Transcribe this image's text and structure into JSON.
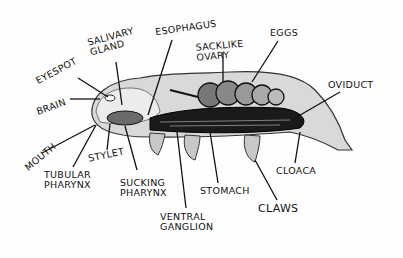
{
  "diagram": {
    "labels": [
      {
        "id": "eyespot",
        "text": "Eyespot"
      },
      {
        "id": "salivary_gland",
        "text": "Salivary Gland"
      },
      {
        "id": "esophagus",
        "text": "Esophagus"
      },
      {
        "id": "sacklike_ovary",
        "text": "Sacklike Ovary"
      },
      {
        "id": "eggs",
        "text": "Eggs"
      },
      {
        "id": "oviduct",
        "text": "Oviduct"
      },
      {
        "id": "brain",
        "text": "Brain"
      },
      {
        "id": "mouth",
        "text": "Mouth"
      },
      {
        "id": "stylet",
        "text": "Stylet"
      },
      {
        "id": "tubular_pharynx",
        "text": "Tubular Pharynx"
      },
      {
        "id": "sucking_pharynx",
        "text": "Sucking Pharynx"
      },
      {
        "id": "ventral_ganglion",
        "text": "Ventral Ganglion"
      },
      {
        "id": "stomach",
        "text": "Stomach"
      },
      {
        "id": "cloaca",
        "text": "Cloaca"
      },
      {
        "id": "claws",
        "text": "Claws"
      }
    ]
  }
}
